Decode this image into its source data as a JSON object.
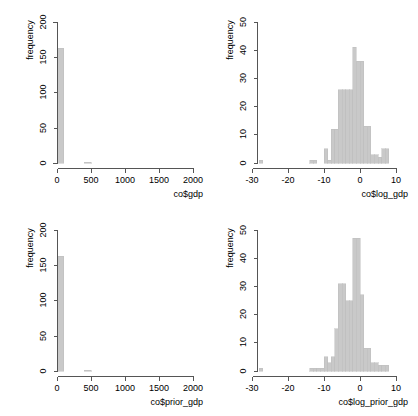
{
  "figure": {
    "background_color": "#ffffff",
    "bar_fill_color": "#c9c9c9",
    "bar_stroke_color": "#bdbdbd",
    "axis_color": "#555555",
    "layout": "2x2 grid of histograms"
  },
  "chart_data": [
    {
      "id": "hist-gdp",
      "type": "bar",
      "subtype": "histogram",
      "title": "",
      "xlabel": "co$gdp",
      "ylabel": "frequency",
      "xlim": [
        -60,
        2100
      ],
      "ylim": [
        0,
        200
      ],
      "xticks": [
        0,
        500,
        1000,
        1500,
        2000
      ],
      "xtick_labels": [
        "0",
        "500",
        "1000",
        "1500",
        "2000"
      ],
      "yticks": [
        0,
        50,
        100,
        150,
        200
      ],
      "ytick_labels": [
        "0",
        "50",
        "100",
        "150",
        "200"
      ],
      "grid": false,
      "legend": "none",
      "bin_width": 100,
      "bin_starts": [
        0,
        100,
        200,
        300,
        400,
        500
      ],
      "values": [
        163,
        0,
        0,
        0,
        1,
        0
      ]
    },
    {
      "id": "hist-log-gdp",
      "type": "bar",
      "subtype": "histogram",
      "title": "",
      "xlabel": "co$log_gdp",
      "ylabel": "frequency",
      "xlim": [
        -32,
        11
      ],
      "ylim": [
        0,
        50
      ],
      "xticks": [
        -30,
        -20,
        -10,
        0,
        10
      ],
      "xtick_labels": [
        "-30",
        "-20",
        "-10",
        "0",
        "10"
      ],
      "yticks": [
        0,
        10,
        20,
        30,
        40,
        50
      ],
      "ytick_labels": [
        "0",
        "10",
        "20",
        "30",
        "40",
        "50"
      ],
      "grid": false,
      "legend": "none",
      "bin_width": 1,
      "bin_starts": [
        -28,
        -14,
        -13,
        -12,
        -11,
        -10,
        -9,
        -8,
        -7,
        -6,
        -5,
        -4,
        -3,
        -2,
        -1,
        0,
        1,
        2,
        3,
        4,
        5,
        6,
        7
      ],
      "values": [
        1,
        1,
        1,
        0,
        0,
        5,
        1,
        12,
        12,
        26,
        26,
        26,
        26,
        41,
        36,
        36,
        13,
        13,
        3,
        3,
        2,
        5,
        5
      ]
    },
    {
      "id": "hist-prior-gdp",
      "type": "bar",
      "subtype": "histogram",
      "title": "",
      "xlabel": "co$prior_gdp",
      "ylabel": "frequency",
      "xlim": [
        -60,
        2100
      ],
      "ylim": [
        0,
        200
      ],
      "xticks": [
        0,
        500,
        1000,
        1500,
        2000
      ],
      "xtick_labels": [
        "0",
        "500",
        "1000",
        "1500",
        "2000"
      ],
      "yticks": [
        0,
        50,
        100,
        150,
        200
      ],
      "ytick_labels": [
        "0",
        "50",
        "100",
        "150",
        "200"
      ],
      "grid": false,
      "legend": "none",
      "bin_width": 100,
      "bin_starts": [
        0,
        100,
        200,
        300,
        400,
        500
      ],
      "values": [
        163,
        0,
        0,
        0,
        1,
        0
      ]
    },
    {
      "id": "hist-log-prior-gdp",
      "type": "bar",
      "subtype": "histogram",
      "title": "",
      "xlabel": "co$log_prior_gdp",
      "ylabel": "frequency",
      "xlim": [
        -32,
        11
      ],
      "ylim": [
        0,
        50
      ],
      "xticks": [
        -30,
        -20,
        -10,
        0,
        10
      ],
      "xtick_labels": [
        "-30",
        "-20",
        "-10",
        "0",
        "10"
      ],
      "yticks": [
        0,
        10,
        20,
        30,
        40,
        50
      ],
      "ytick_labels": [
        "0",
        "10",
        "20",
        "30",
        "40",
        "50"
      ],
      "grid": false,
      "legend": "none",
      "bin_width": 1,
      "bin_starts": [
        -28,
        -14,
        -13,
        -12,
        -11,
        -10,
        -9,
        -8,
        -7,
        -6,
        -5,
        -4,
        -3,
        -2,
        -1,
        0,
        1,
        2,
        3,
        4,
        5,
        6,
        7
      ],
      "values": [
        1,
        1,
        1,
        1,
        1,
        5,
        3,
        5,
        15,
        31,
        31,
        25,
        25,
        47,
        47,
        27,
        8,
        8,
        3,
        3,
        2,
        2,
        2
      ]
    }
  ]
}
